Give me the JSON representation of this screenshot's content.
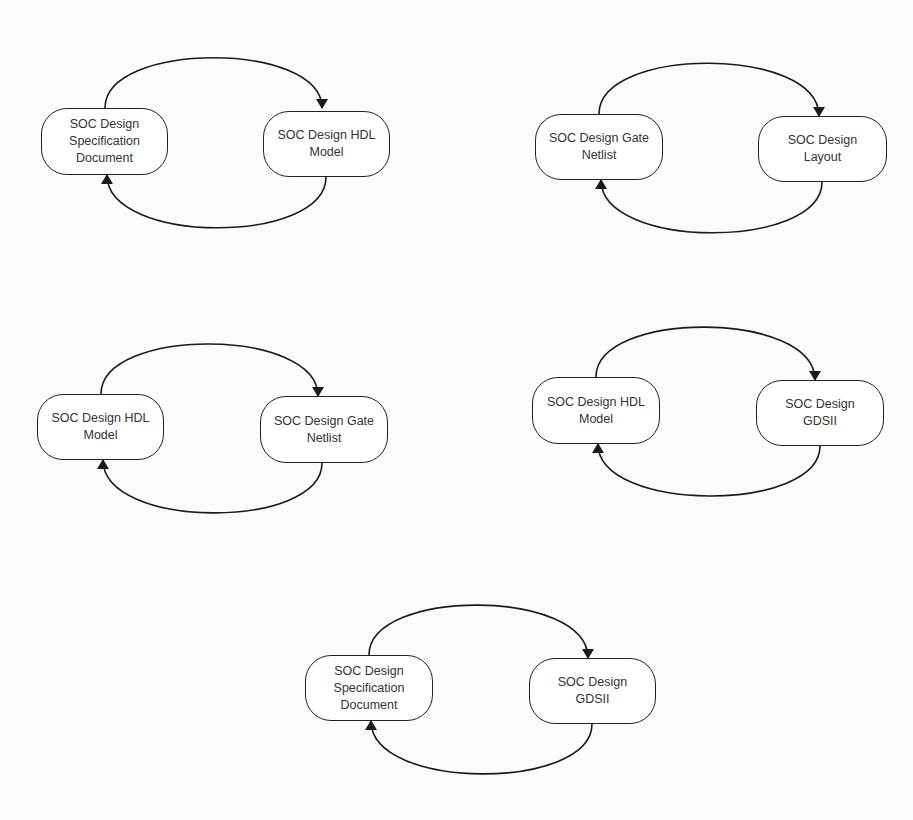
{
  "diagrams": [
    {
      "id": "d1",
      "left": {
        "label": "SOC Design\nSpecification\nDocument",
        "x": 41,
        "y": 108,
        "w": 127,
        "h": 67
      },
      "right": {
        "label": "SOC Design HDL\nModel",
        "x": 263,
        "y": 111,
        "w": 127,
        "h": 66
      },
      "top_arc": {
        "from": [
          105,
          108
        ],
        "peak_y": 41,
        "to": [
          322,
          108
        ]
      },
      "bottom_arc": {
        "from": [
          326,
          177
        ],
        "low_y": 245,
        "to": [
          107,
          175
        ]
      }
    },
    {
      "id": "d2",
      "left": {
        "label": "SOC Design Gate\nNetlist",
        "x": 535,
        "y": 114,
        "w": 128,
        "h": 66
      },
      "right": {
        "label": "SOC Design\nLayout",
        "x": 758,
        "y": 116,
        "w": 129,
        "h": 66
      },
      "top_arc": {
        "from": [
          599,
          114
        ],
        "peak_y": 46,
        "to": [
          819,
          116
        ]
      },
      "bottom_arc": {
        "from": [
          822,
          182
        ],
        "low_y": 250,
        "to": [
          601,
          180
        ]
      }
    },
    {
      "id": "d3",
      "left": {
        "label": "SOC Design HDL\nModel",
        "x": 37,
        "y": 394,
        "w": 127,
        "h": 66
      },
      "right": {
        "label": "SOC Design Gate\nNetlist",
        "x": 260,
        "y": 396,
        "w": 128,
        "h": 67
      },
      "top_arc": {
        "from": [
          101,
          394
        ],
        "peak_y": 327,
        "to": [
          318,
          396
        ]
      },
      "bottom_arc": {
        "from": [
          322,
          463
        ],
        "low_y": 530,
        "to": [
          103,
          460
        ]
      }
    },
    {
      "id": "d4",
      "left": {
        "label": "SOC Design HDL\nModel",
        "x": 532,
        "y": 377,
        "w": 128,
        "h": 67
      },
      "right": {
        "label": "SOC Design\nGDSII",
        "x": 756,
        "y": 380,
        "w": 128,
        "h": 66
      },
      "top_arc": {
        "from": [
          596,
          377
        ],
        "peak_y": 310,
        "to": [
          815,
          380
        ]
      },
      "bottom_arc": {
        "from": [
          820,
          446
        ],
        "low_y": 513,
        "to": [
          598,
          444
        ]
      }
    },
    {
      "id": "d5",
      "left": {
        "label": "SOC Design\nSpecification\nDocument",
        "x": 305,
        "y": 655,
        "w": 128,
        "h": 66
      },
      "right": {
        "label": "SOC Design\nGDSII",
        "x": 529,
        "y": 658,
        "w": 127,
        "h": 66
      },
      "top_arc": {
        "from": [
          369,
          655
        ],
        "peak_y": 588,
        "to": [
          588,
          658
        ]
      },
      "bottom_arc": {
        "from": [
          592,
          724
        ],
        "low_y": 791,
        "to": [
          371,
          721
        ]
      }
    }
  ],
  "style": {
    "stroke": "#1a1a1a",
    "node_border": "#222222",
    "text": "#333333",
    "background": "#fbfbfb"
  }
}
